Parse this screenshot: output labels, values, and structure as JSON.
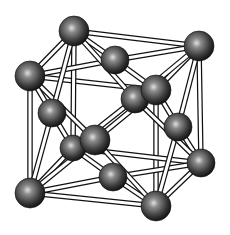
{
  "diagram": {
    "type": "crystal-lattice",
    "colors": {
      "background": "#ffffff",
      "bond_fill": "#ffffff",
      "bond_stroke": "#111111",
      "atom_dark": "#1a1a1a",
      "atom_mid": "#555555",
      "atom_light": "#d8d8d8"
    },
    "atom_radius": 15,
    "atoms": [
      {
        "id": "back-bottom-left",
        "x": 73,
        "y": 148,
        "r": 13
      },
      {
        "id": "back-face-center",
        "x": 135,
        "y": 99,
        "r": 14
      },
      {
        "id": "back-top-left",
        "x": 74,
        "y": 31,
        "r": 15
      },
      {
        "id": "back-top-right",
        "x": 199,
        "y": 46,
        "r": 15
      },
      {
        "id": "top-face-center",
        "x": 115,
        "y": 60,
        "r": 14
      },
      {
        "id": "back-bottom-right",
        "x": 201,
        "y": 163,
        "r": 14
      },
      {
        "id": "bottom-face-center",
        "x": 113,
        "y": 177,
        "r": 14
      },
      {
        "id": "left-face-center",
        "x": 52,
        "y": 113,
        "r": 14
      },
      {
        "id": "right-face-center",
        "x": 178,
        "y": 127,
        "r": 14
      },
      {
        "id": "front-top-left",
        "x": 30,
        "y": 76,
        "r": 15
      },
      {
        "id": "front-top-right",
        "x": 156,
        "y": 90,
        "r": 15
      },
      {
        "id": "front-face-center",
        "x": 95,
        "y": 140,
        "r": 15
      },
      {
        "id": "front-bottom-left",
        "x": 30,
        "y": 193,
        "r": 15
      },
      {
        "id": "front-bottom-right",
        "x": 156,
        "y": 206,
        "r": 15
      }
    ],
    "bonds": [
      [
        "back-top-left",
        "back-top-right"
      ],
      [
        "back-top-left",
        "front-top-left"
      ],
      [
        "back-top-right",
        "front-top-right"
      ],
      [
        "front-top-left",
        "front-top-right"
      ],
      [
        "back-top-left",
        "back-bottom-left"
      ],
      [
        "front-top-left",
        "front-bottom-left"
      ],
      [
        "front-top-right",
        "front-bottom-right"
      ],
      [
        "back-top-right",
        "back-bottom-right"
      ],
      [
        "back-bottom-left",
        "back-bottom-right"
      ],
      [
        "front-bottom-left",
        "front-bottom-right"
      ],
      [
        "back-bottom-right",
        "front-bottom-right"
      ],
      [
        "back-bottom-left",
        "front-bottom-left"
      ],
      [
        "top-face-center",
        "back-top-left"
      ],
      [
        "top-face-center",
        "back-top-right"
      ],
      [
        "top-face-center",
        "front-top-left"
      ],
      [
        "top-face-center",
        "front-top-right"
      ],
      [
        "bottom-face-center",
        "back-bottom-left"
      ],
      [
        "bottom-face-center",
        "back-bottom-right"
      ],
      [
        "bottom-face-center",
        "front-bottom-left"
      ],
      [
        "bottom-face-center",
        "front-bottom-right"
      ],
      [
        "front-face-center",
        "front-top-left"
      ],
      [
        "front-face-center",
        "front-top-right"
      ],
      [
        "front-face-center",
        "front-bottom-left"
      ],
      [
        "front-face-center",
        "front-bottom-right"
      ],
      [
        "left-face-center",
        "back-top-left"
      ],
      [
        "left-face-center",
        "front-top-left"
      ],
      [
        "left-face-center",
        "back-bottom-left"
      ],
      [
        "left-face-center",
        "front-bottom-left"
      ],
      [
        "right-face-center",
        "back-top-right"
      ],
      [
        "right-face-center",
        "front-top-right"
      ],
      [
        "right-face-center",
        "back-bottom-right"
      ],
      [
        "right-face-center",
        "front-bottom-right"
      ],
      [
        "back-face-center",
        "back-top-left"
      ],
      [
        "back-face-center",
        "back-top-right"
      ],
      [
        "back-face-center",
        "back-bottom-left"
      ],
      [
        "back-face-center",
        "back-bottom-right"
      ]
    ]
  }
}
